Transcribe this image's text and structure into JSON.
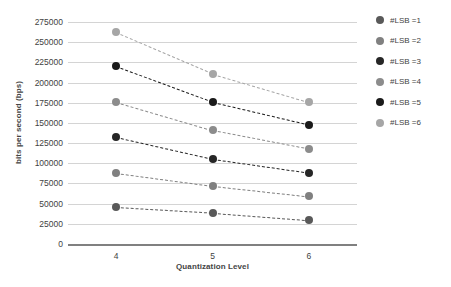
{
  "chart_data": {
    "type": "line",
    "title": "",
    "xlabel": "Quantization Level",
    "ylabel": "bits per second (bps)",
    "categories": [
      "4",
      "5",
      "6"
    ],
    "x": [
      4,
      5,
      6
    ],
    "ylim": [
      0,
      275000
    ],
    "ytick_step": 25000,
    "yticks": [
      275000,
      250000,
      225000,
      200000,
      175000,
      150000,
      125000,
      100000,
      75000,
      50000,
      25000,
      0
    ],
    "ytick_labels": [
      "275000",
      "250000",
      "225000",
      "200000",
      "175000",
      "150000",
      "125000",
      "100000",
      "75000",
      "50000",
      "25000",
      "0"
    ],
    "grid": true,
    "legend_position": "right",
    "line_style": "dashed",
    "marker": "circle",
    "series": [
      {
        "name": "#LSB =1",
        "color": "#595959",
        "values": [
          46000,
          39000,
          30000
        ]
      },
      {
        "name": "#LSB =2",
        "color": "#808080",
        "values": [
          88000,
          72000,
          59000
        ]
      },
      {
        "name": "#LSB =3",
        "color": "#262626",
        "values": [
          132000,
          105000,
          88000
        ]
      },
      {
        "name": "#LSB =4",
        "color": "#8c8c8c",
        "values": [
          176000,
          141000,
          118000
        ]
      },
      {
        "name": "#LSB =5",
        "color": "#1a1a1a",
        "values": [
          220000,
          176000,
          148000
        ]
      },
      {
        "name": "#LSB =6",
        "color": "#a6a6a6",
        "values": [
          262000,
          211000,
          176000
        ]
      }
    ]
  },
  "legend": {
    "items": [
      {
        "label": "#LSB =1",
        "color": "#595959"
      },
      {
        "label": "#LSB =2",
        "color": "#808080"
      },
      {
        "label": "#LSB =3",
        "color": "#262626"
      },
      {
        "label": "#LSB =4",
        "color": "#8c8c8c"
      },
      {
        "label": "#LSB =5",
        "color": "#1a1a1a"
      },
      {
        "label": "#LSB =6",
        "color": "#a6a6a6"
      }
    ]
  }
}
